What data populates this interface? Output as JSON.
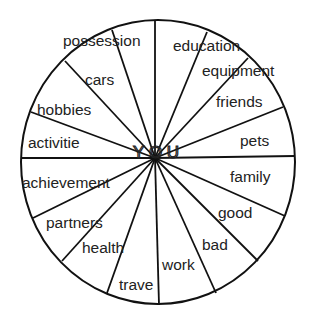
{
  "diagram": {
    "type": "wheel",
    "center_label": "YOU",
    "colors": {
      "line": "#111111",
      "text": "#222222",
      "background": "#ffffff"
    },
    "circle": {
      "cx": 158,
      "cy": 162,
      "rx": 137,
      "ry": 142
    },
    "hub": {
      "x": 155,
      "y": 158
    },
    "segments": [
      {
        "label": "possession",
        "x": 63,
        "y": 46
      },
      {
        "label": "education",
        "x": 173,
        "y": 51
      },
      {
        "label": "equipment",
        "x": 202,
        "y": 76
      },
      {
        "label": "friends",
        "x": 216,
        "y": 107
      },
      {
        "label": "pets",
        "x": 240,
        "y": 146
      },
      {
        "label": "family",
        "x": 230,
        "y": 182
      },
      {
        "label": "good",
        "x": 218,
        "y": 218
      },
      {
        "label": "bad",
        "x": 202,
        "y": 250
      },
      {
        "label": "work",
        "x": 162,
        "y": 270
      },
      {
        "label": "trave",
        "x": 119,
        "y": 290
      },
      {
        "label": "health",
        "x": 82,
        "y": 253
      },
      {
        "label": "partners",
        "x": 46,
        "y": 228
      },
      {
        "label": "achievement",
        "x": 22,
        "y": 188
      },
      {
        "label": "activitie",
        "x": 28,
        "y": 148
      },
      {
        "label": "hobbies",
        "x": 37,
        "y": 115
      },
      {
        "label": "cars",
        "x": 85,
        "y": 85
      }
    ],
    "spokes": [
      [
        155,
        21
      ],
      [
        112,
        30
      ],
      [
        65,
        61
      ],
      [
        31,
        112
      ],
      [
        21,
        158
      ],
      [
        33,
        218
      ],
      [
        62,
        261
      ],
      [
        107,
        293
      ],
      [
        159,
        305
      ],
      [
        216,
        293
      ],
      [
        258,
        261
      ],
      [
        285,
        216
      ],
      [
        295,
        156
      ],
      [
        283,
        107
      ],
      [
        248,
        58
      ],
      [
        207,
        32
      ]
    ]
  }
}
